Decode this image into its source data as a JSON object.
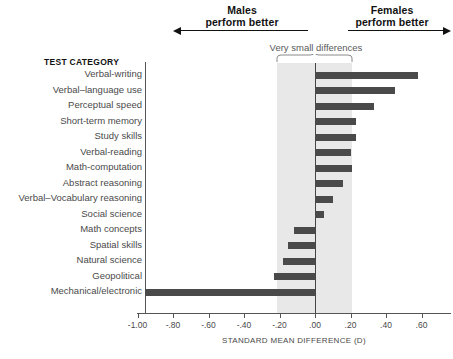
{
  "annotations": {
    "males_line1": "Males",
    "males_line2": "perform better",
    "females_line1": "Females",
    "females_line2": "perform better",
    "very_small_differences": "Very small differences",
    "column_header": "TEST CATEGORY"
  },
  "colors": {
    "bar": "#4a4a4a",
    "band": "#e8e8e8",
    "axis": "#555555",
    "text": "#4a4a4a",
    "heading": "#111111"
  },
  "chart_data": {
    "type": "bar",
    "orientation": "horizontal",
    "title": "",
    "xlabel": "STANDARD MEAN DIFFERENCE (D)",
    "ylabel": "TEST CATEGORY",
    "xlim": [
      -1.0,
      0.68
    ],
    "xticks": [
      -1.0,
      -0.8,
      -0.6,
      -0.4,
      -0.2,
      0.0,
      0.2,
      0.4,
      0.6
    ],
    "xticklabels": [
      "-1.00",
      "-.80",
      "-.60",
      "-.40",
      "-.20",
      ".00",
      ".20",
      ".40",
      ".60"
    ],
    "grid": false,
    "legend": null,
    "shaded_band": {
      "label": "Very small differences",
      "from": -0.2,
      "to": 0.2
    },
    "categories": [
      "Verbal-writing",
      "Verbal–language use",
      "Perceptual speed",
      "Short-term memory",
      "Study skills",
      "Verbal-reading",
      "Math-computation",
      "Abstract reasoning",
      "Verbal–Vocabulary reasoning",
      "Social science",
      "Math concepts",
      "Spatial skills",
      "Natural science",
      "Geopolitical",
      "Mechanical/electronic"
    ],
    "values": [
      0.58,
      0.45,
      0.33,
      0.23,
      0.23,
      0.2,
      0.21,
      0.16,
      0.1,
      0.05,
      -0.12,
      -0.15,
      -0.18,
      -0.23,
      -0.96
    ]
  }
}
